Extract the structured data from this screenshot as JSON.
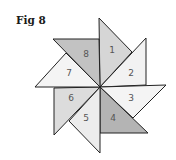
{
  "figure": {
    "label": "Fig 8",
    "segments": [
      {
        "id": "1",
        "color": "#d6d6d6",
        "points": "99,18 100,87 132,52",
        "label_pos": [
          112,
          53
        ]
      },
      {
        "id": "2",
        "color": "#f2f2f2",
        "points": "146,38 146,85 100,87",
        "label_pos": [
          131,
          76
        ]
      },
      {
        "id": "3",
        "color": "#f4f4f4",
        "points": "166,85 100,87 133,118",
        "label_pos": [
          131,
          101
        ]
      },
      {
        "id": "4",
        "color": "#b4b4b4",
        "points": "148,133 100,133 100,87",
        "label_pos": [
          113,
          121
        ]
      },
      {
        "id": "5",
        "color": "#ececec",
        "points": "100,153 69,121 100,87",
        "label_pos": [
          86,
          121
        ]
      },
      {
        "id": "6",
        "color": "#dcdcdc",
        "points": "54,135 54,88 100,87",
        "label_pos": [
          71,
          101
        ]
      },
      {
        "id": "7",
        "color": "#f4f4f4",
        "points": "35,87 66,53 100,87",
        "label_pos": [
          69,
          76
        ]
      },
      {
        "id": "8",
        "color": "#c2c2c2",
        "points": "53,39 99,39 100,87",
        "label_pos": [
          86,
          57
        ]
      }
    ],
    "stroke": "#222222"
  }
}
